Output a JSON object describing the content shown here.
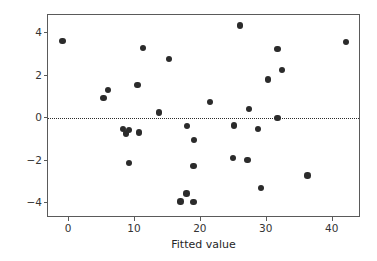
{
  "chart_data": {
    "type": "scatter",
    "title": "",
    "xlabel": "Fitted value",
    "ylabel": "Residuals",
    "xlim": [
      -3.2,
      44.3
    ],
    "ylim": [
      -4.7,
      4.85
    ],
    "xticks": [
      0,
      10,
      20,
      30,
      40
    ],
    "xticklabels": [
      "0",
      "10",
      "20",
      "30",
      "40"
    ],
    "yticks": [
      -4,
      -2,
      0,
      2,
      4
    ],
    "yticklabels": [
      "−4",
      "−2",
      "0",
      "2",
      "4"
    ],
    "grid": false,
    "legend": null,
    "marker_color": "#2b2b2b",
    "marker_size_px": 6.4,
    "annotations": [
      {
        "type": "hline",
        "y": 0,
        "style": "dotted",
        "color": "#2b2b2b",
        "label": "zero residual reference line"
      }
    ],
    "x": [
      -1.0,
      5.2,
      5.9,
      8.2,
      8.6,
      9.1,
      9.1,
      10.4,
      10.6,
      11.2,
      13.6,
      15.2,
      16.9,
      17.8,
      17.9,
      18.9,
      18.9,
      19.0,
      21.4,
      24.9,
      25.0,
      25.9,
      27.1,
      27.3,
      28.7,
      29.1,
      30.2,
      31.6,
      31.6,
      32.3,
      36.2,
      42.0
    ],
    "y": [
      3.62,
      0.95,
      1.32,
      -0.5,
      -0.72,
      -2.12,
      -0.55,
      1.57,
      -0.68,
      3.3,
      0.27,
      2.77,
      -3.93,
      -3.55,
      -0.38,
      -3.95,
      -2.24,
      -1.02,
      0.75,
      -1.88,
      -0.35,
      4.35,
      -1.98,
      0.42,
      -0.5,
      -3.3,
      1.81,
      0.0,
      3.24,
      2.25,
      -2.7,
      3.57
    ],
    "n_points": 32
  }
}
